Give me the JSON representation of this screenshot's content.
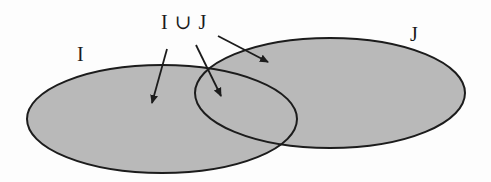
{
  "diagram": {
    "type": "venn",
    "labels": {
      "union": "I ∪ J",
      "set_i": "I",
      "set_j": "J"
    },
    "sets": [
      {
        "name": "I",
        "cx": 162,
        "cy": 119,
        "rx": 135,
        "ry": 54
      },
      {
        "name": "J",
        "cx": 330,
        "cy": 93,
        "rx": 135,
        "ry": 55
      }
    ],
    "arrows": [
      {
        "from": [
          167,
          49
        ],
        "to": [
          152,
          103
        ],
        "target": "I only region"
      },
      {
        "from": [
          196,
          45
        ],
        "to": [
          221,
          96
        ],
        "target": "intersection region"
      },
      {
        "from": [
          218,
          36
        ],
        "to": [
          268,
          62
        ],
        "target": "J only region"
      }
    ],
    "colors": {
      "fill": "#b9b9b9",
      "stroke": "#1c1c1c",
      "arrow": "#1c1c1c",
      "background": "#fdfdfd"
    }
  }
}
